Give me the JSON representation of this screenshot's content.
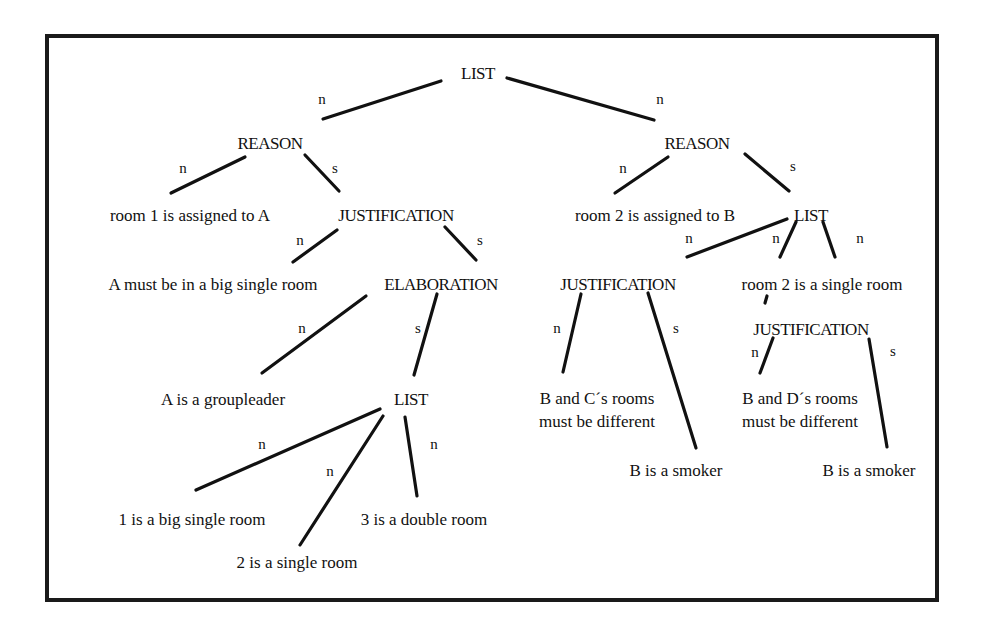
{
  "diagram": {
    "frame": {
      "x": 45,
      "y": 34,
      "w": 890,
      "h": 564
    },
    "nodes": [
      {
        "id": "list_root",
        "kind": "rel",
        "text": "LIST",
        "x": 478,
        "y": 75
      },
      {
        "id": "reason_1",
        "kind": "rel",
        "text": "REASON",
        "x": 270,
        "y": 145
      },
      {
        "id": "reason_2",
        "kind": "rel",
        "text": "REASON",
        "x": 697,
        "y": 145
      },
      {
        "id": "room1_assigned",
        "kind": "leaf",
        "text": "room 1 is assigned to A",
        "x": 190,
        "y": 217
      },
      {
        "id": "justification_1",
        "kind": "rel",
        "text": "JUSTIFICATION",
        "x": 396,
        "y": 217
      },
      {
        "id": "room2_assigned",
        "kind": "leaf",
        "text": "room 2 is assigned to B",
        "x": 655,
        "y": 217
      },
      {
        "id": "list_2",
        "kind": "rel",
        "text": "LIST",
        "x": 811,
        "y": 217
      },
      {
        "id": "a_big_single",
        "kind": "leaf",
        "text": "A must be in a big single room",
        "x": 213,
        "y": 286
      },
      {
        "id": "elaboration",
        "kind": "rel",
        "text": "ELABORATION",
        "x": 441,
        "y": 286
      },
      {
        "id": "justification_2",
        "kind": "rel",
        "text": "JUSTIFICATION",
        "x": 618,
        "y": 286
      },
      {
        "id": "room2_single",
        "kind": "leaf",
        "text": "room 2 is a single room",
        "x": 822,
        "y": 286
      },
      {
        "id": "justification_3",
        "kind": "rel",
        "text": "JUSTIFICATION",
        "x": 811,
        "y": 331
      },
      {
        "id": "a_groupleader",
        "kind": "leaf",
        "text": "A is a groupleader",
        "x": 223,
        "y": 401
      },
      {
        "id": "list_3",
        "kind": "rel",
        "text": "LIST",
        "x": 411,
        "y": 401
      },
      {
        "id": "b_c_rooms_1",
        "kind": "leaf",
        "text": "B and C´s rooms",
        "x": 597,
        "y": 400
      },
      {
        "id": "b_c_rooms_2",
        "kind": "leaf",
        "text": "must be different",
        "x": 597,
        "y": 423
      },
      {
        "id": "b_d_rooms_1",
        "kind": "leaf",
        "text": "B and D´s rooms",
        "x": 800,
        "y": 400
      },
      {
        "id": "b_d_rooms_2",
        "kind": "leaf",
        "text": "must be different",
        "x": 800,
        "y": 423
      },
      {
        "id": "b_smoker_1",
        "kind": "leaf",
        "text": "B is a smoker",
        "x": 676,
        "y": 472
      },
      {
        "id": "b_smoker_2",
        "kind": "leaf",
        "text": "B is a smoker",
        "x": 869,
        "y": 472
      },
      {
        "id": "room1_big",
        "kind": "leaf",
        "text": "1 is a big single room",
        "x": 192,
        "y": 521
      },
      {
        "id": "room3_double",
        "kind": "leaf",
        "text": "3 is a double room",
        "x": 424,
        "y": 521
      },
      {
        "id": "room2_single_b",
        "kind": "leaf",
        "text": "2 is a single room",
        "x": 297,
        "y": 564
      }
    ],
    "edges": [
      {
        "from": "list_root",
        "to": "reason_1",
        "label": "n",
        "x1": 441,
        "y1": 81,
        "x2": 323,
        "y2": 119,
        "lx": 322,
        "ly": 101
      },
      {
        "from": "list_root",
        "to": "reason_2",
        "label": "n",
        "x1": 507,
        "y1": 78,
        "x2": 654,
        "y2": 120,
        "lx": 660,
        "ly": 101
      },
      {
        "from": "reason_1",
        "to": "room1_assigned",
        "label": "n",
        "x1": 245,
        "y1": 157,
        "x2": 171,
        "y2": 193,
        "lx": 183,
        "ly": 170
      },
      {
        "from": "reason_1",
        "to": "justification_1",
        "label": "s",
        "x1": 305,
        "y1": 155,
        "x2": 339,
        "y2": 191,
        "lx": 335,
        "ly": 170
      },
      {
        "from": "reason_2",
        "to": "room2_assigned",
        "label": "n",
        "x1": 668,
        "y1": 157,
        "x2": 615,
        "y2": 193,
        "lx": 623,
        "ly": 170
      },
      {
        "from": "reason_2",
        "to": "list_2",
        "label": "s",
        "x1": 745,
        "y1": 154,
        "x2": 789,
        "y2": 191,
        "lx": 793,
        "ly": 168
      },
      {
        "from": "justification_1",
        "to": "a_big_single",
        "label": "n",
        "x1": 337,
        "y1": 230,
        "x2": 293,
        "y2": 262,
        "lx": 300,
        "ly": 242
      },
      {
        "from": "justification_1",
        "to": "elaboration",
        "label": "s",
        "x1": 445,
        "y1": 227,
        "x2": 476,
        "y2": 260,
        "lx": 480,
        "ly": 242
      },
      {
        "from": "list_2",
        "to": "justification_2",
        "label": "n",
        "x1": 787,
        "y1": 219,
        "x2": 687,
        "y2": 257,
        "lx": 689,
        "ly": 240
      },
      {
        "from": "list_2",
        "to": "room2_single",
        "label": "n",
        "x1": 796,
        "y1": 222,
        "x2": 780,
        "y2": 257,
        "lx": 776,
        "ly": 240
      },
      {
        "from": "list_2",
        "to": "room2_single",
        "label": "n",
        "x1": 823,
        "y1": 222,
        "x2": 835,
        "y2": 257,
        "lx": 860,
        "ly": 240
      },
      {
        "from": "room2_single",
        "to": "justification_3",
        "label": "",
        "x1": 767,
        "y1": 296,
        "x2": 765,
        "y2": 303,
        "lx": 0,
        "ly": 0
      },
      {
        "from": "elaboration",
        "to": "a_groupleader",
        "label": "n",
        "x1": 366,
        "y1": 296,
        "x2": 262,
        "y2": 373,
        "lx": 302,
        "ly": 330
      },
      {
        "from": "elaboration",
        "to": "list_3",
        "label": "s",
        "x1": 437,
        "y1": 294,
        "x2": 414,
        "y2": 375,
        "lx": 418,
        "ly": 330
      },
      {
        "from": "justification_2",
        "to": "b_c_rooms_1",
        "label": "n",
        "x1": 581,
        "y1": 294,
        "x2": 563,
        "y2": 372,
        "lx": 557,
        "ly": 330
      },
      {
        "from": "justification_2",
        "to": "b_smoker_1",
        "label": "s",
        "x1": 648,
        "y1": 293,
        "x2": 696,
        "y2": 448,
        "lx": 676,
        "ly": 330
      },
      {
        "from": "justification_3",
        "to": "b_d_rooms_1",
        "label": "n",
        "x1": 773,
        "y1": 338,
        "x2": 760,
        "y2": 373,
        "lx": 755,
        "ly": 354
      },
      {
        "from": "justification_3",
        "to": "b_smoker_2",
        "label": "s",
        "x1": 869,
        "y1": 339,
        "x2": 887,
        "y2": 447,
        "lx": 893,
        "ly": 353
      },
      {
        "from": "list_3",
        "to": "room1_big",
        "label": "n",
        "x1": 380,
        "y1": 409,
        "x2": 196,
        "y2": 490,
        "lx": 262,
        "ly": 446
      },
      {
        "from": "list_3",
        "to": "room2_single_b",
        "label": "n",
        "x1": 383,
        "y1": 416,
        "x2": 300,
        "y2": 545,
        "lx": 330,
        "ly": 473
      },
      {
        "from": "list_3",
        "to": "room3_double",
        "label": "n",
        "x1": 405,
        "y1": 417,
        "x2": 417,
        "y2": 496,
        "lx": 434,
        "ly": 446
      }
    ]
  }
}
